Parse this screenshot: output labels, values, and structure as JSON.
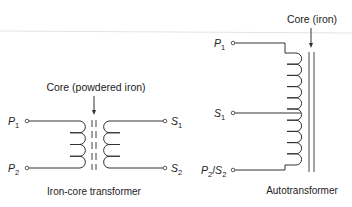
{
  "iron_core": {
    "caption": "Iron-core transformer",
    "core_label": "Core (powdered iron)",
    "terminals": [
      {
        "name": "P",
        "sub": "1"
      },
      {
        "name": "P",
        "sub": "2"
      },
      {
        "name": "S",
        "sub": "1"
      },
      {
        "name": "S",
        "sub": "2"
      }
    ]
  },
  "auto": {
    "caption": "Autotransformer",
    "core_label": "Core (iron)",
    "terminals": [
      {
        "name": "P",
        "sub": "1"
      },
      {
        "name": "S",
        "sub": "1"
      },
      {
        "name": "P",
        "sub": "2",
        "name2": "S",
        "sub2": "2",
        "sep": "/"
      }
    ]
  },
  "colors": {
    "line": "#333333",
    "background": "#ffffff"
  }
}
